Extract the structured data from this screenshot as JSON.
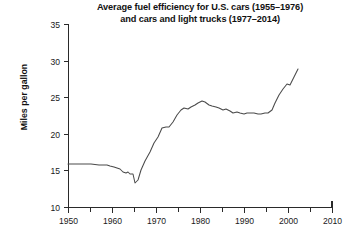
{
  "chart_data": {
    "type": "line",
    "title": "Average fuel efficiency for U.S. cars (1955–1976)\nand cars and light trucks (1977–2014)",
    "title_line1": "Average fuel efficiency for U.S. cars (1955–1976)",
    "title_line2": "and cars and light trucks (1977–2014)",
    "xlabel": "",
    "ylabel": "Miles per gallon",
    "xlim": [
      1950,
      2010
    ],
    "ylim": [
      10,
      35
    ],
    "grid": false,
    "legend": false,
    "x_ticks": [
      1950,
      1960,
      1970,
      1980,
      1990,
      2000,
      2010
    ],
    "x_tick_labels": [
      "1950",
      "1960",
      "1970",
      "1980",
      "1990",
      "2000",
      "2010"
    ],
    "x_minor_ticks": [
      1955,
      1965,
      1975,
      1985,
      1995,
      2005
    ],
    "y_ticks": [
      10,
      15,
      20,
      25,
      30,
      35
    ],
    "y_tick_labels": [
      "10",
      "15",
      "20",
      "25",
      "30",
      "35"
    ],
    "line_color": "#4a4a4a",
    "axis_color": "#2a2a2a",
    "background_color": "#ffffff",
    "series": [
      {
        "name": "Average fuel efficiency",
        "x": [
          1950,
          1952,
          1955,
          1957,
          1959,
          1960,
          1961,
          1962,
          1963,
          1964,
          1965,
          1966,
          1967,
          1968,
          1969,
          1970,
          1971,
          1972,
          1973,
          1974,
          1975,
          1976,
          1977,
          1978,
          1979,
          1980,
          1981,
          1982,
          1983,
          1984,
          1985,
          1986,
          1987,
          1988,
          1989,
          1990,
          1991,
          1992,
          1993,
          1994,
          1995,
          1996,
          1997,
          1998,
          1999,
          2000,
          2001,
          2002,
          2003,
          2004,
          2005,
          2006,
          2007,
          2008,
          2009,
          2010,
          2011,
          2012,
          2013,
          2014
        ],
        "values": [
          16.0,
          16.0,
          16.0,
          15.9,
          15.9,
          15.8,
          15.7,
          15.6,
          15.4,
          15.1,
          15.0,
          15.1,
          14.9,
          14.9,
          13.5,
          14.0,
          15.6,
          17.0,
          18.6,
          19.9,
          21.0,
          22.3,
          22.4,
          22.5,
          23.2,
          24.3,
          25.1,
          25.5,
          25.4,
          25.6,
          26.0,
          26.3,
          26.6,
          26.5,
          26.0,
          25.8,
          25.6,
          25.5,
          25.2,
          25.3,
          25.0,
          24.8,
          24.9,
          24.8,
          24.6,
          24.8,
          24.7,
          24.8,
          24.6,
          24.6,
          24.8,
          24.7,
          25.2,
          26.4,
          27.7,
          28.6,
          29.4,
          29.3,
          30.5,
          31.9
        ],
        "pixel_path": "M68,164 L79,164 L91,164 L99,165 L107,165 L110,166 L114,167 L117,168 L120,169 L123,172 L126,173 L128,172 L130,174 L133,174 L135,183 L138,180 L141,170 L145,161 L150,152 L154,143 L158,137 L162,128 L166,127 L169,127 L173,122 L177,115 L181,110 L184,108 L188,109 L191,107 L195,105 L198,103 L202,101 L205,102 L209,105 L212,106 L216,107 L219,108 L223,110 L226,109 L230,111 L233,113 L237,112 L240,113 L244,114 L247,113 L251,113 L254,113 L258,114 L261,114 L265,113 L268,113 L272,110 L275,103 L279,95 L283,89 L287,84 L290,85 L294,77 L298,69"
      }
    ]
  },
  "axes": {
    "plot_left_px": 68,
    "plot_right_px": 332,
    "plot_top_px": 24,
    "plot_bottom_px": 207
  }
}
